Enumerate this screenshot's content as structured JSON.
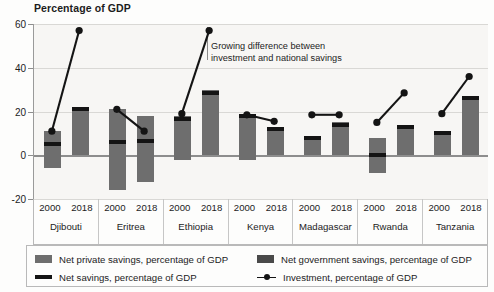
{
  "chart_data": {
    "type": "bar",
    "title": "Percentage of GDP",
    "ylabel": "Percentage of GDP",
    "xlabel": "",
    "ylim": [
      -20,
      60
    ],
    "yticks": [
      -20,
      0,
      20,
      40,
      60
    ],
    "grid": true,
    "legend_position": "bottom",
    "categories": [
      "Djibouti 2000",
      "Djibouti 2018",
      "Eritrea 2000",
      "Eritrea 2018",
      "Ethiopia 2000",
      "Ethiopia 2018",
      "Kenya 2000",
      "Kenya 2018",
      "Madagascar 2000",
      "Madagascar 2018",
      "Rwanda 2000",
      "Rwanda 2018",
      "Tanzania 2000",
      "Tanzania 2018"
    ],
    "countries": [
      "Djibouti",
      "Eritrea",
      "Ethiopia",
      "Kenya",
      "Madagascar",
      "Rwanda",
      "Tanzania"
    ],
    "years": [
      "2000",
      "2018"
    ],
    "series": [
      {
        "name": "Net private savings, percentage of GDP",
        "key": "private",
        "color": "#6e6e6e",
        "values": [
          {
            "low": -6,
            "high": 11
          },
          {
            "low": 0,
            "high": 22
          },
          {
            "low": -16,
            "high": 21
          },
          {
            "low": -12,
            "high": 18
          },
          {
            "low": -2,
            "high": 18
          },
          {
            "low": 0,
            "high": 30
          },
          {
            "low": -2,
            "high": 19
          },
          {
            "low": 0,
            "high": 13
          },
          {
            "low": 0,
            "high": 9
          },
          {
            "low": 0,
            "high": 15
          },
          {
            "low": -8,
            "high": 8
          },
          {
            "low": 0,
            "high": 14
          },
          {
            "low": 0,
            "high": 11
          },
          {
            "low": 0,
            "high": 27
          }
        ]
      },
      {
        "name": "Net government savings, percentage of GDP",
        "key": "government",
        "color": "#4a4a4a",
        "values": [
          null,
          null,
          null,
          null,
          null,
          null,
          null,
          null,
          null,
          null,
          null,
          null,
          null,
          null
        ]
      },
      {
        "name": "Net savings, percentage of GDP",
        "key": "net_savings",
        "color": "#141414",
        "values": [
          5,
          21,
          6,
          6.5,
          16.5,
          28.5,
          18,
          12,
          8,
          14,
          0,
          13,
          10,
          26
        ]
      },
      {
        "name": "Investment, percentage of GDP",
        "key": "investment",
        "color": "#141414",
        "values": [
          11,
          57,
          21,
          11,
          19,
          57,
          18.5,
          15.5,
          18.5,
          18.5,
          15,
          28.5,
          19,
          36
        ]
      }
    ],
    "annotation": {
      "line1": "Growing difference between",
      "line2": "investment and national savings"
    }
  },
  "legend": {
    "items": [
      {
        "label": "Net private savings, percentage of GDP",
        "swatch": "private-swatch"
      },
      {
        "label": "Net government savings, percentage of GDP",
        "swatch": "government-swatch"
      },
      {
        "label": "Net savings, percentage of GDP",
        "swatch": "net-savings-swatch"
      },
      {
        "label": "Investment, percentage of GDP",
        "swatch": "investment-swatch"
      }
    ]
  }
}
